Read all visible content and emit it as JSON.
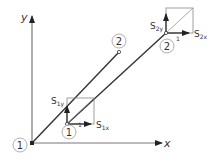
{
  "diagram": {
    "axes": {
      "x_label": "x",
      "y_label": "y"
    },
    "nodes": [
      {
        "id": "1",
        "label": "1"
      },
      {
        "id": "2",
        "label": "2"
      },
      {
        "id": "1p",
        "label": "1",
        "prime": "1"
      },
      {
        "id": "2p",
        "label": "2",
        "prime": "1"
      }
    ],
    "vectors": {
      "s1x": {
        "main": "S",
        "sub": "1x"
      },
      "s1y": {
        "main": "S",
        "sub": "1y"
      },
      "s2x": {
        "main": "S",
        "sub": "2x"
      },
      "s2y": {
        "main": "S",
        "sub": "2y"
      }
    },
    "colors": {
      "line": "#333333",
      "box": "#777777",
      "circle": "#888888"
    }
  }
}
